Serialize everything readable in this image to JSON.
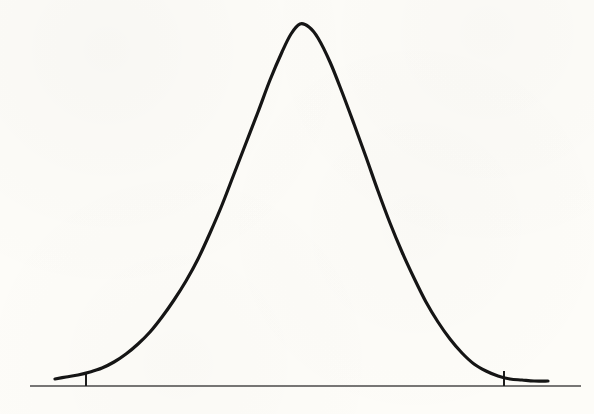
{
  "figure": {
    "background_color": "#fdfcf8",
    "curve_color": "#151515",
    "axis_color": "#4a4a4a",
    "tick_color": "#1c1c1c",
    "curve_stroke_width": 3.2,
    "axis_stroke_width": 1.6,
    "tick_stroke_width": 2.0
  },
  "chart_data": {
    "type": "line",
    "title": "",
    "subtitle": "",
    "xlabel": "",
    "ylabel": "",
    "legend": [],
    "legend_position": "none",
    "grid": false,
    "axis": {
      "baseline_y_px": 386,
      "baseline_x_start_px": 30,
      "baseline_x_end_px": 581,
      "xlim": [
        -3.6,
        3.6
      ],
      "ylim": [
        0,
        1
      ]
    },
    "ticks": [
      {
        "label": "",
        "x_px": 86,
        "x_value": -2.45,
        "y_top_px": 374,
        "y_bottom_px": 386
      },
      {
        "label": "",
        "x_px": 504,
        "x_value": 2.45,
        "y_top_px": 371,
        "y_bottom_px": 386
      }
    ],
    "annotations": [],
    "curve": {
      "name": "gaussian",
      "peak_x_px": 300,
      "peak_y_px": 24,
      "mean": 0,
      "sigma": 1,
      "x_start_px": 55,
      "x_end_px": 548,
      "points_px": [
        [
          55,
          379
        ],
        [
          66,
          377
        ],
        [
          78,
          375
        ],
        [
          90,
          372
        ],
        [
          102,
          368
        ],
        [
          114,
          362
        ],
        [
          126,
          354
        ],
        [
          138,
          344
        ],
        [
          150,
          332
        ],
        [
          162,
          317
        ],
        [
          174,
          300
        ],
        [
          186,
          281
        ],
        [
          198,
          259
        ],
        [
          210,
          233
        ],
        [
          222,
          205
        ],
        [
          234,
          174
        ],
        [
          246,
          143
        ],
        [
          258,
          112
        ],
        [
          270,
          80
        ],
        [
          282,
          52
        ],
        [
          291,
          34
        ],
        [
          300,
          24
        ],
        [
          309,
          27
        ],
        [
          318,
          38
        ],
        [
          330,
          62
        ],
        [
          342,
          92
        ],
        [
          354,
          124
        ],
        [
          366,
          157
        ],
        [
          378,
          191
        ],
        [
          390,
          223
        ],
        [
          402,
          252
        ],
        [
          414,
          278
        ],
        [
          426,
          302
        ],
        [
          438,
          322
        ],
        [
          450,
          339
        ],
        [
          462,
          353
        ],
        [
          474,
          364
        ],
        [
          486,
          371
        ],
        [
          498,
          376
        ],
        [
          510,
          379
        ],
        [
          522,
          380
        ],
        [
          534,
          381
        ],
        [
          548,
          381
        ]
      ],
      "y_values_normalized": [
        0.019,
        0.025,
        0.03,
        0.039,
        0.05,
        0.066,
        0.088,
        0.116,
        0.149,
        0.19,
        0.237,
        0.29,
        0.35,
        0.422,
        0.499,
        0.585,
        0.67,
        0.756,
        0.844,
        0.921,
        0.971,
        1.0,
        0.992,
        0.962,
        0.895,
        0.812,
        0.724,
        0.633,
        0.539,
        0.451,
        0.371,
        0.299,
        0.232,
        0.177,
        0.13,
        0.091,
        0.061,
        0.041,
        0.028,
        0.019,
        0.017,
        0.014,
        0.014
      ]
    }
  }
}
